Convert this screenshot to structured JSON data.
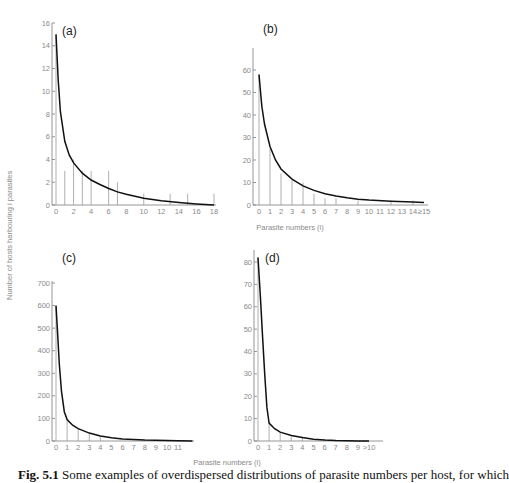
{
  "figure": {
    "y_axis_title": "Number of hosts harbouring i parasites",
    "x_axis_title_top": "Parasite numbers (i)",
    "x_axis_title_bottom": "Parasite numbers (i)",
    "caption_label": "Fig. 5.1",
    "caption_text": "Some examples of overdispersed distributions of parasite numbers per host, for which"
  },
  "chart_data": [
    {
      "panel": "(a)",
      "type": "bar",
      "title": "(a)",
      "xlabel": "Parasite numbers (i)",
      "ylabel": "Number of hosts harbouring i parasites",
      "ylim": [
        0,
        16
      ],
      "yticks": [
        0,
        2,
        4,
        6,
        8,
        10,
        12,
        14,
        16
      ],
      "xlim": [
        0,
        18
      ],
      "xticks": [
        "0",
        "2",
        "4",
        "6",
        "8",
        "10",
        "12",
        "14",
        "16",
        "18"
      ],
      "xtick_values": [
        0,
        2,
        4,
        6,
        8,
        10,
        12,
        14,
        16,
        18
      ],
      "bars": {
        "x": [
          0,
          1,
          2,
          3,
          4,
          6,
          7,
          10,
          13,
          15,
          18
        ],
        "values": [
          15,
          3,
          4,
          3,
          3,
          3,
          2,
          1,
          1,
          1,
          1
        ]
      },
      "fit_curve": {
        "x": [
          0,
          0.25,
          0.5,
          1,
          1.5,
          2,
          3,
          4,
          5,
          6,
          7,
          8,
          10,
          12,
          14,
          16,
          18
        ],
        "values": [
          15,
          11,
          8.2,
          5.6,
          4.4,
          3.7,
          2.8,
          2.2,
          1.8,
          1.45,
          1.15,
          0.95,
          0.6,
          0.38,
          0.22,
          0.1,
          0.0
        ]
      },
      "grid": false,
      "layout": {
        "x0": 56,
        "x1": 214,
        "y0": 205,
        "y1": 23,
        "axis_x": 52,
        "axis_top": 23,
        "axis_right": 216,
        "label_x": 62,
        "label_y": 35
      }
    },
    {
      "panel": "(b)",
      "type": "bar",
      "title": "(b)",
      "xlabel": "Parasite numbers (i)",
      "ylabel": "Number of hosts harbouring i parasites",
      "ylim": [
        0,
        60
      ],
      "yticks": [
        0,
        10,
        20,
        30,
        40,
        50,
        60
      ],
      "xlim": [
        0,
        15
      ],
      "xticks": [
        "0",
        "1",
        "2",
        "3",
        "4",
        "5",
        "6",
        "7",
        "8",
        "9",
        "10",
        "11",
        "12",
        "13",
        "14",
        "≥15"
      ],
      "xtick_values": [
        0,
        1,
        2,
        3,
        4,
        5,
        6,
        7,
        8,
        9,
        10,
        11,
        12,
        13,
        14,
        15
      ],
      "bars": {
        "x": [
          0,
          1,
          2,
          3,
          4,
          5,
          6,
          7,
          9,
          12,
          14
        ],
        "values": [
          58,
          25,
          14,
          11,
          10,
          5,
          3,
          3,
          2,
          2,
          2
        ]
      },
      "fit_curve": {
        "x": [
          0,
          0.25,
          0.5,
          1,
          1.5,
          2,
          3,
          4,
          5,
          6,
          7,
          8,
          9,
          10,
          12,
          14,
          15
        ],
        "values": [
          58,
          44,
          36,
          26,
          20,
          16,
          11.5,
          8.5,
          6.5,
          5,
          4,
          3.2,
          2.6,
          2.2,
          1.7,
          1.3,
          1.1
        ]
      },
      "grid": false,
      "layout": {
        "x0": 259,
        "x1": 424,
        "y0": 205,
        "y1": 70,
        "axis_x": 253,
        "axis_top": 48,
        "axis_right": 428,
        "label_x": 263,
        "label_y": 33
      }
    },
    {
      "panel": "(c)",
      "type": "bar",
      "title": "(c)",
      "xlabel": "Parasite numbers (i)",
      "ylabel": "Number of hosts harbouring i parasites",
      "ylim": [
        0,
        700
      ],
      "yticks": [
        0,
        100,
        200,
        300,
        400,
        500,
        600,
        700
      ],
      "xlim": [
        0,
        11
      ],
      "xticks": [
        "0",
        "1",
        "2",
        "3",
        "4",
        "5",
        "6",
        "7",
        "8",
        "9",
        "10",
        "11"
      ],
      "xtick_values": [
        0,
        1,
        2,
        3,
        4,
        5,
        6,
        7,
        8,
        9,
        10,
        11
      ],
      "bars": {
        "x": [
          0,
          1,
          2,
          3,
          4,
          8,
          10
        ],
        "values": [
          600,
          95,
          55,
          35,
          20,
          5,
          5
        ]
      },
      "fit_curve": {
        "x": [
          0,
          0.15,
          0.3,
          0.5,
          0.75,
          1,
          1.5,
          2,
          3,
          4,
          5,
          6,
          7,
          8,
          9,
          10,
          11,
          12.3
        ],
        "values": [
          600,
          470,
          340,
          220,
          130,
          95,
          70,
          55,
          35,
          22,
          14,
          9,
          6,
          4,
          3,
          2,
          1,
          0
        ]
      },
      "grid": false,
      "layout": {
        "x0": 56,
        "x1": 178,
        "y0": 441,
        "y1": 283,
        "axis_x": 52,
        "axis_top": 281,
        "axis_right": 194,
        "label_x": 62,
        "label_y": 262
      }
    },
    {
      "panel": "(d)",
      "type": "bar",
      "title": "(d)",
      "xlabel": "Parasite numbers (i)",
      "ylabel": "Number of hosts harbouring i parasites",
      "ylim": [
        0,
        80
      ],
      "yticks": [
        0,
        10,
        20,
        30,
        40,
        50,
        60,
        70,
        80
      ],
      "xlim": [
        0,
        10
      ],
      "xticks": [
        "0",
        "1",
        "2",
        "3",
        "4",
        "5",
        "6",
        "7",
        "8",
        "9",
        ">10"
      ],
      "xtick_values": [
        0,
        1,
        2,
        3,
        4,
        5,
        6,
        7,
        8,
        9,
        10
      ],
      "bars": {
        "x": [
          0,
          1,
          2,
          3,
          4,
          6
        ],
        "values": [
          82,
          8,
          4,
          2,
          2,
          1
        ]
      },
      "fit_curve": {
        "x": [
          0,
          0.2,
          0.4,
          0.6,
          0.8,
          1,
          1.5,
          2,
          3,
          4,
          5,
          6,
          7,
          8,
          9,
          10
        ],
        "values": [
          82,
          66,
          48,
          30,
          15,
          8,
          5.5,
          4,
          2.5,
          1.5,
          0.8,
          0.4,
          0.2,
          0.1,
          0.05,
          0.0
        ]
      },
      "grid": false,
      "layout": {
        "x0": 258,
        "x1": 369,
        "y0": 441,
        "y1": 262,
        "axis_x": 254,
        "axis_top": 250,
        "axis_right": 383,
        "label_x": 265,
        "label_y": 262
      }
    }
  ]
}
